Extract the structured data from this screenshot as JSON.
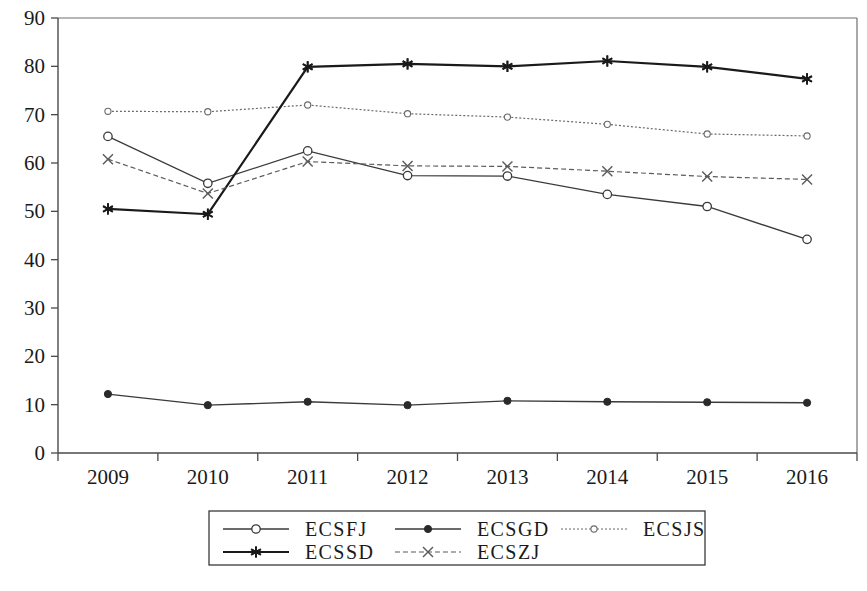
{
  "chart_data": {
    "type": "line",
    "title": "",
    "subtitle": "",
    "xlabel": "",
    "ylabel": "",
    "categories": [
      "2009",
      "2010",
      "2011",
      "2012",
      "2013",
      "2014",
      "2015",
      "2016"
    ],
    "x": [
      2009,
      2010,
      2011,
      2012,
      2013,
      2014,
      2015,
      2016
    ],
    "ylim": [
      0,
      90
    ],
    "yticks": [
      0,
      10,
      20,
      30,
      40,
      50,
      60,
      70,
      80,
      90
    ],
    "ytick_labels": [
      "0",
      "10",
      "20",
      "30",
      "40",
      "50",
      "60",
      "70",
      "80",
      "90"
    ],
    "grid": false,
    "legend_position": "bottom-center",
    "series": [
      {
        "name": "ECSFJ",
        "values": [
          65.5,
          55.8,
          62.5,
          57.4,
          57.3,
          53.5,
          51.0,
          44.2
        ],
        "marker": "open-circle",
        "line_style": "solid",
        "color": "#3a3a3a",
        "line_width": 1.3
      },
      {
        "name": "ECSGD",
        "values": [
          12.2,
          9.9,
          10.6,
          9.9,
          10.8,
          10.6,
          10.5,
          10.4
        ],
        "marker": "filled-circle",
        "line_style": "solid",
        "color": "#3a3a3a",
        "line_width": 1.3
      },
      {
        "name": "ECSJS",
        "values": [
          70.7,
          70.6,
          72.0,
          70.2,
          69.5,
          68.0,
          66.0,
          65.6
        ],
        "marker": "small-open-circle",
        "line_style": "dotted",
        "color": "#6a6a6a",
        "line_width": 1.2
      },
      {
        "name": "ECSSD",
        "values": [
          50.5,
          49.4,
          79.9,
          80.5,
          80.0,
          81.1,
          79.9,
          77.4
        ],
        "marker": "star",
        "line_style": "solid",
        "color": "#1a1a1a",
        "line_width": 2.2
      },
      {
        "name": "ECSZJ",
        "values": [
          60.8,
          53.7,
          60.3,
          59.4,
          59.3,
          58.3,
          57.2,
          56.6
        ],
        "marker": "cross-x",
        "line_style": "dashed",
        "color": "#5a5a5a",
        "line_width": 1.2
      }
    ],
    "legend_entries": [
      {
        "label": "ECSFJ",
        "marker": "open-circle"
      },
      {
        "label": "ECSGD",
        "marker": "filled-circle"
      },
      {
        "label": "ECSJS",
        "marker": "small-open-circle"
      },
      {
        "label": "ECSSD",
        "marker": "star"
      },
      {
        "label": "ECSZJ",
        "marker": "cross-x"
      }
    ]
  },
  "axes": {
    "y_axis_name": "value-axis",
    "x_axis_name": "year-axis"
  },
  "colors": {
    "background": "#ffffff",
    "axis": "#4a4a4a",
    "text": "#1a1a1a"
  }
}
